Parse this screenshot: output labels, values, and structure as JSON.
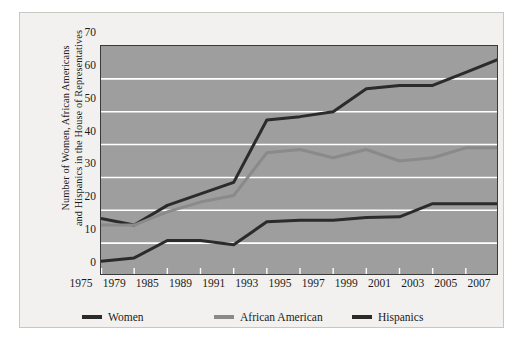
{
  "chart_data": {
    "type": "line",
    "title": "",
    "xlabel": "",
    "ylabel": "Number of Women, African Americans and Hispanics in the House of Representatives",
    "ylabel_lines": [
      "Number of Women, African Americans",
      "and Hispanics in the House of Representatives"
    ],
    "categories": [
      "1975",
      "1979",
      "1985",
      "1989",
      "1991",
      "1993",
      "1995",
      "1997",
      "1999",
      "2001",
      "2003",
      "2005",
      "2007"
    ],
    "x": [
      1975,
      1979,
      1985,
      1989,
      1991,
      1993,
      1995,
      1997,
      1999,
      2001,
      2003,
      2005,
      2007
    ],
    "ylim": [
      0,
      70
    ],
    "yticks": [
      0,
      10,
      20,
      30,
      40,
      50,
      60,
      70
    ],
    "ytick_labels": [
      "0",
      "10",
      "20",
      "30",
      "40",
      "50",
      "60",
      "70"
    ],
    "grid": true,
    "grid_color": "#ffffff",
    "plot_background": "#9e9e9e",
    "legend_position": "bottom",
    "series": [
      {
        "name": "Women",
        "color": "#2b2b2b",
        "values": [
          17.5,
          15.5,
          21.5,
          25,
          28.5,
          47.5,
          48.5,
          50,
          57,
          58,
          58,
          62,
          66
        ]
      },
      {
        "name": "African American",
        "color": "#8a8a8a",
        "values": [
          15.5,
          15.5,
          19.5,
          22.5,
          24.5,
          37.5,
          38.5,
          36,
          38.5,
          35,
          36,
          39,
          39
        ]
      },
      {
        "name": "Hispanics",
        "color": "#2b2b2b",
        "values": [
          4.5,
          5.5,
          10.8,
          10.8,
          9.5,
          16.5,
          17,
          17,
          17.8,
          18,
          22,
          22,
          22
        ]
      }
    ]
  },
  "legend": {
    "items": [
      {
        "label": "Women",
        "color": "#2b2b2b"
      },
      {
        "label": "African American",
        "color": "#8a8a8a"
      },
      {
        "label": "Hispanics",
        "color": "#2b2b2b"
      }
    ]
  }
}
